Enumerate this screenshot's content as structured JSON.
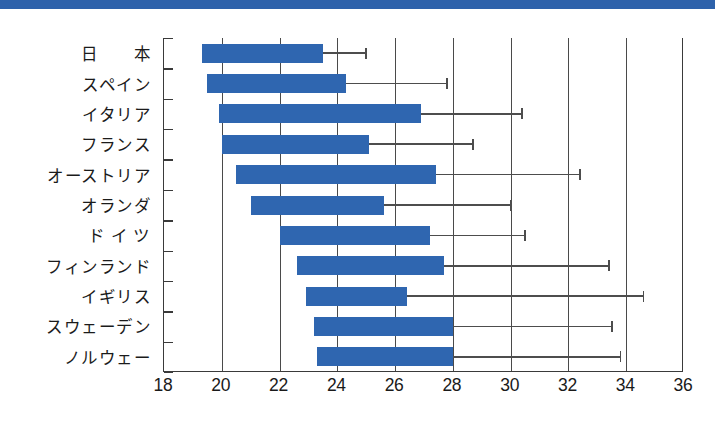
{
  "chart_data": {
    "type": "bar",
    "orientation": "horizontal",
    "title": "",
    "xlabel": "",
    "ylabel": "",
    "xlim": [
      18,
      36
    ],
    "xticks": [
      18,
      20,
      22,
      24,
      26,
      28,
      30,
      32,
      34,
      36
    ],
    "xtick_labels": [
      "18",
      "20",
      "22",
      "24",
      "26",
      "28",
      "30",
      "32",
      "34",
      "36"
    ],
    "grid": true,
    "grid_axis": "x",
    "legend": "none",
    "bar_color": "#2f66b0",
    "whisker_color": "#4d4d4d",
    "axis_color": "#3a3a3a",
    "categories": [
      "日　　本",
      "スペイン",
      "イタリア",
      "フランス",
      "オーストリア",
      "オランダ",
      "ド イ ツ",
      "フィンランド",
      "イギリス",
      "スウェーデン",
      "ノルウェー"
    ],
    "series": [
      {
        "name": "range-bar",
        "note": "bar spans from start to end value; whisker extends from end to max",
        "items": [
          {
            "category": "日　　本",
            "start": 19.3,
            "end": 23.5,
            "whisker_max": 25.0
          },
          {
            "category": "スペイン",
            "start": 19.5,
            "end": 24.3,
            "whisker_max": 27.8
          },
          {
            "category": "イタリア",
            "start": 19.9,
            "end": 26.9,
            "whisker_max": 30.4
          },
          {
            "category": "フランス",
            "start": 20.0,
            "end": 25.1,
            "whisker_max": 28.7
          },
          {
            "category": "オーストリア",
            "start": 20.5,
            "end": 27.4,
            "whisker_max": 32.4
          },
          {
            "category": "オランダ",
            "start": 21.0,
            "end": 25.6,
            "whisker_max": 30.0
          },
          {
            "category": "ド イ ツ",
            "start": 22.0,
            "end": 27.2,
            "whisker_max": 30.5
          },
          {
            "category": "フィンランド",
            "start": 22.6,
            "end": 27.7,
            "whisker_max": 33.4
          },
          {
            "category": "イギリス",
            "start": 22.9,
            "end": 26.4,
            "whisker_max": 34.6
          },
          {
            "category": "スウェーデン",
            "start": 23.2,
            "end": 28.0,
            "whisker_max": 33.5
          },
          {
            "category": "ノルウェー",
            "start": 23.3,
            "end": 28.0,
            "whisker_max": 33.8
          }
        ]
      }
    ]
  },
  "banner": {
    "color": "#2e62ab"
  }
}
